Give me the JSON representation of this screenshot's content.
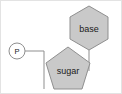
{
  "diagram": {
    "background_color": "#ffffff",
    "frame_color": "#e3e3e3",
    "shape_fill_color": "#c9c9c9",
    "shape_stroke_color": "#8f8f8f",
    "connector_color": "#8f8f8f",
    "label_color": "#1a1a1a",
    "nodes": {
      "phosphate": {
        "label": "P",
        "shape": "circle",
        "fill": "#ffffff",
        "cx": 16,
        "cy": 50,
        "r": 8
      },
      "sugar": {
        "label": "sugar",
        "shape": "pentagon",
        "fill": "#c9c9c9",
        "cx": 67,
        "cy": 69,
        "r": 23
      },
      "base": {
        "label": "base",
        "shape": "hexagon",
        "fill": "#c9c9c9",
        "cx": 88,
        "cy": 27,
        "r": 22
      }
    },
    "connectors": [
      {
        "name": "phosphate-to-sugar",
        "from": "phosphate",
        "to": "sugar",
        "path": "M 24 50 L 43 50 L 43 88"
      },
      {
        "name": "sugar-to-base",
        "from": "sugar",
        "to": "base",
        "path": "M 88 49 L 88 70"
      }
    ]
  }
}
